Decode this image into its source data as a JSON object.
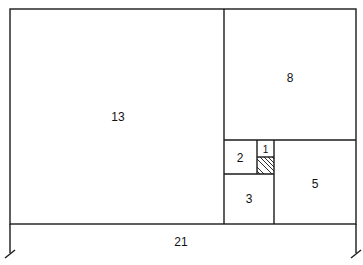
{
  "diagram": {
    "colors": {
      "line": "#1a1a1a",
      "background": "#ffffff",
      "text": "#111111"
    },
    "outer": {
      "x": 10,
      "y": 9,
      "w": 346,
      "h": 215
    },
    "squares": [
      {
        "id": "sq13",
        "label": "13",
        "x": 10,
        "y": 9,
        "w": 214,
        "h": 215,
        "lx": 118,
        "ly": 121
      },
      {
        "id": "sq8",
        "label": "8",
        "x": 224,
        "y": 9,
        "w": 132,
        "h": 131,
        "lx": 290,
        "ly": 82
      },
      {
        "id": "sq5",
        "label": "5",
        "x": 274,
        "y": 140,
        "w": 82,
        "h": 84,
        "lx": 315,
        "ly": 187
      },
      {
        "id": "sq3",
        "label": "3",
        "x": 224,
        "y": 174,
        "w": 50,
        "h": 50,
        "lx": 249,
        "ly": 203
      },
      {
        "id": "sq2",
        "label": "2",
        "x": 224,
        "y": 140,
        "w": 33,
        "h": 34,
        "lx": 240,
        "ly": 161
      },
      {
        "id": "sq1",
        "label": "1",
        "x": 257,
        "y": 140,
        "w": 17,
        "h": 17,
        "lx": 265,
        "ly": 153
      },
      {
        "id": "sq1b",
        "label": "",
        "x": 257,
        "y": 157,
        "w": 17,
        "h": 17,
        "hatched": true
      }
    ],
    "dimension": {
      "label": "21",
      "lx": 181,
      "ly": 246,
      "x1": 10,
      "x2": 356,
      "y_top": 224,
      "y_bottom": 253
    }
  }
}
